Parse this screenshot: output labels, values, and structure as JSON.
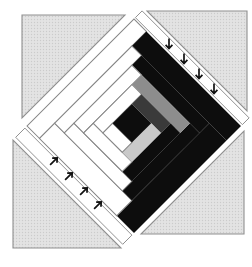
{
  "figure": {
    "type": "quilt-block-diagram",
    "canvas": {
      "width": 252,
      "height": 267
    },
    "colors": {
      "background": "#ffffff",
      "triangle_fill": "#e3e3e3",
      "triangle_dot": "#cbcbcb",
      "triangle_stroke": "#8f8f8f",
      "white_log": "#ffffff",
      "log_stroke": "#858585",
      "black": "#0d0d0d",
      "dark_gray": "#3a3a3a",
      "medium_gray": "#8d8d8d",
      "light_gray": "#c9c9c9",
      "arrow": "#111111"
    },
    "corner_triangles": [
      {
        "name": "corner-triangle-top-left",
        "points": "22,15 125,15 22,118"
      },
      {
        "name": "corner-triangle-top-right",
        "points": "147,11 247,11 247,111"
      },
      {
        "name": "corner-triangle-bottom-left",
        "points": "13,140 13,248 121,248"
      },
      {
        "name": "corner-triangle-bottom-right",
        "points": "244,131 244,234 141,234"
      }
    ],
    "block": {
      "name": "log-cabin-block",
      "transform": "translate(134,126) rotate(45) scale(0.976) translate(-77.5,-77.5)",
      "side": 155,
      "pieces": [
        {
          "name": "log-r4-left",
          "x": 0,
          "y": 0,
          "w": 18,
          "h": 155,
          "color": "white_log"
        },
        {
          "name": "log-r4-top",
          "x": 18,
          "y": 0,
          "w": 137,
          "h": 21,
          "color": "black"
        },
        {
          "name": "log-r4-right",
          "x": 130,
          "y": 21,
          "w": 25,
          "h": 134,
          "color": "black"
        },
        {
          "name": "log-r4-bottom",
          "x": 18,
          "y": 133,
          "w": 112,
          "h": 22,
          "color": "white_log"
        },
        {
          "name": "log-r3-left",
          "x": 18,
          "y": 21,
          "w": 14,
          "h": 112,
          "color": "white_log"
        },
        {
          "name": "log-r3-top",
          "x": 32,
          "y": 21,
          "w": 98,
          "h": 14,
          "color": "black"
        },
        {
          "name": "log-r3-right",
          "x": 116,
          "y": 35,
          "w": 14,
          "h": 98,
          "color": "black"
        },
        {
          "name": "log-r3-bottom",
          "x": 32,
          "y": 119,
          "w": 84,
          "h": 14,
          "color": "white_log"
        },
        {
          "name": "log-r2-left",
          "x": 32,
          "y": 35,
          "w": 14,
          "h": 84,
          "color": "white_log"
        },
        {
          "name": "log-r2-top",
          "x": 46,
          "y": 35,
          "w": 70,
          "h": 14,
          "color": "medium_gray"
        },
        {
          "name": "log-r2-right",
          "x": 102,
          "y": 49,
          "w": 14,
          "h": 70,
          "color": "black"
        },
        {
          "name": "log-r2-bottom",
          "x": 46,
          "y": 105,
          "w": 56,
          "h": 14,
          "color": "white_log"
        },
        {
          "name": "log-r1-left",
          "x": 46,
          "y": 49,
          "w": 14,
          "h": 56,
          "color": "white_log"
        },
        {
          "name": "log-r1-top",
          "x": 60,
          "y": 49,
          "w": 42,
          "h": 14,
          "color": "dark_gray"
        },
        {
          "name": "log-r1-right",
          "x": 88,
          "y": 63,
          "w": 14,
          "h": 42,
          "color": "light_gray"
        },
        {
          "name": "log-r1-bottom",
          "x": 60,
          "y": 91,
          "w": 28,
          "h": 14,
          "color": "white_log"
        },
        {
          "name": "center-square",
          "x": 60,
          "y": 63,
          "w": 28,
          "h": 28,
          "color": "black"
        }
      ]
    },
    "arrow_glyph": "M 0 5.5 L 0 -4.5 M -3.4 -0.8 L 0 -4.5 L 3.4 -0.8",
    "arrow_strips": [
      {
        "name": "pressing-strip-top-right",
        "points": "135.4,17.6 242.4,124.6 249.1,117.9 142.1,10.9",
        "arrow_count": 4,
        "direction_deg": 180,
        "arrows": [
          {
            "x": 169,
            "y": 44
          },
          {
            "x": 184,
            "y": 59
          },
          {
            "x": 199,
            "y": 74
          },
          {
            "x": 214,
            "y": 89
          }
        ]
      },
      {
        "name": "pressing-strip-bottom-left",
        "points": "24.9,128.1 131.9,235.1 122.7,244.3 15.7,137.3",
        "arrow_count": 4,
        "direction_deg": 45,
        "arrows": [
          {
            "x": 54,
            "y": 161
          },
          {
            "x": 69,
            "y": 176
          },
          {
            "x": 84,
            "y": 191
          },
          {
            "x": 98,
            "y": 205
          }
        ]
      }
    ]
  }
}
